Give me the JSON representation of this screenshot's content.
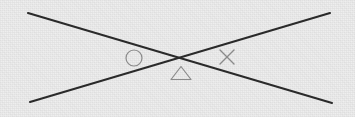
{
  "figure": {
    "width": 355,
    "height": 117,
    "background_color": "#ededed",
    "line_color": "#2a2a2a",
    "glyph_color": "#8a8a8a",
    "line_width": 2.1,
    "glyph_stroke_width": 1.2
  },
  "lines": [
    {
      "name": "line-descending",
      "description": "straight line from upper-left to lower-right",
      "x1": 28,
      "y1": 13,
      "x2": 332,
      "y2": 103
    },
    {
      "name": "line-ascending",
      "description": "straight line from lower-left to upper-right",
      "x1": 30,
      "y1": 102,
      "x2": 330,
      "y2": 13
    }
  ],
  "intersection": {
    "label": "crossing-point",
    "x": 180,
    "y": 57
  },
  "glyphs": [
    {
      "name": "circle-glyph",
      "shape": "circle",
      "symbol": "○",
      "cx": 134,
      "cy": 58,
      "r": 8,
      "color": "#8a8a8a",
      "position_note": "left of crossing point"
    },
    {
      "name": "triangle-glyph",
      "shape": "triangle",
      "symbol": "△",
      "cx": 181,
      "cy": 73,
      "half_width": 10,
      "height": 13,
      "color": "#8a8a8a",
      "position_note": "below crossing point"
    },
    {
      "name": "cross-glyph",
      "shape": "x-mark",
      "symbol": "×",
      "cx": 227,
      "cy": 57,
      "half_size": 7,
      "color": "#8a8a8a",
      "position_note": "right of crossing point"
    }
  ]
}
